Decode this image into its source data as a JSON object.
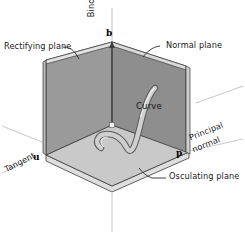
{
  "figure": {
    "background_color": "#ffffff"
  },
  "labels": {
    "rectifying_plane": "Rectifying plane",
    "normal_plane": "Normal plane",
    "osculating_plane": "Osculating plane",
    "binormal_axis": "Binormal",
    "tangent_axis": "Tangent",
    "principal_normal_line1": "Principal",
    "principal_normal_line2": "normal",
    "curve": "Curve"
  },
  "vertices": {
    "binormal_point": "b",
    "tangent_point": "u",
    "principal_point": "p"
  },
  "colors": {
    "left_wall": "#9a9a9a",
    "right_wall": "#8e8e8e",
    "floor": "#c9c9c9",
    "slab_edge": "#dcdcdc",
    "slab_edge_dark": "#6e6e6e",
    "outline": "#3b3b3b",
    "curve_fill": "#cfcfcf",
    "curve_outline": "#5a5a5a",
    "axis_line": "#b4b4b4",
    "leader": "#2a2a2a",
    "text": "#1a1a1a"
  }
}
